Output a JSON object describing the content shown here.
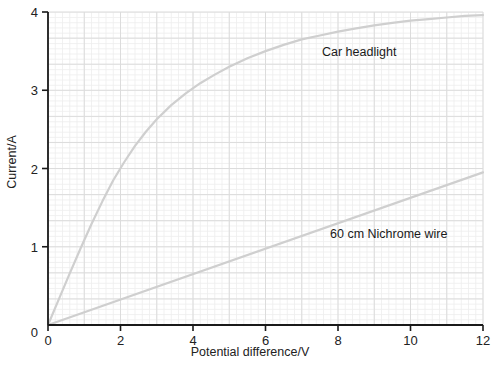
{
  "chart_data": {
    "type": "line",
    "title": "",
    "xlabel": "Potential difference/V",
    "ylabel": "Current/A",
    "xlim": [
      0,
      12
    ],
    "ylim": [
      0,
      4
    ],
    "xticks": [
      0,
      2,
      4,
      6,
      8,
      10,
      12
    ],
    "yticks": [
      0,
      1,
      2,
      3,
      4
    ],
    "xtick_labels": [
      "0",
      "2",
      "4",
      "6",
      "8",
      "10",
      "12"
    ],
    "ytick_labels": [
      "0",
      "1",
      "2",
      "3",
      "4"
    ],
    "grid": true,
    "grid_minor_step_x": 0.2,
    "grid_minor_step_y": 0.0666,
    "grid_major_step_x": 1,
    "grid_major_step_y": 0.3333,
    "legend": "inline-annotations",
    "series": [
      {
        "name": "Car headlight",
        "color": "#cfcfcf",
        "label_position": {
          "x": 7.55,
          "y": 3.52
        },
        "x": [
          0,
          0.3,
          0.6,
          0.9,
          1.2,
          1.5,
          1.8,
          2.1,
          2.4,
          2.7,
          3.0,
          3.4,
          3.8,
          4.2,
          4.6,
          5.0,
          5.5,
          6.0,
          6.5,
          7.0,
          7.5,
          8.0,
          8.5,
          9.0,
          9.5,
          10.0,
          10.5,
          11.0,
          11.5,
          12.0
        ],
        "y": [
          0,
          0.33,
          0.66,
          0.98,
          1.29,
          1.58,
          1.85,
          2.08,
          2.29,
          2.47,
          2.63,
          2.81,
          2.96,
          3.09,
          3.2,
          3.3,
          3.41,
          3.5,
          3.58,
          3.65,
          3.7,
          3.75,
          3.79,
          3.83,
          3.86,
          3.89,
          3.91,
          3.93,
          3.95,
          3.96
        ]
      },
      {
        "name": "60 cm Nichrome wire",
        "color": "#cfcfcf",
        "label_position": {
          "x": 7.8,
          "y": 1.18
        },
        "x": [
          0,
          12
        ],
        "y": [
          0,
          1.95
        ]
      }
    ]
  },
  "axes": {
    "x_axis_name": "Potential difference/V",
    "y_axis_name": "Current/A"
  },
  "annotations": {
    "car_headlight": "Car headlight",
    "nichrome_wire": "60 cm Nichrome wire"
  },
  "colors": {
    "axis": "#1a1a1a",
    "grid_minor": "#eeeeee",
    "grid_major": "#dcdcdc",
    "curve": "#cfcfcf",
    "background": "#ffffff"
  }
}
